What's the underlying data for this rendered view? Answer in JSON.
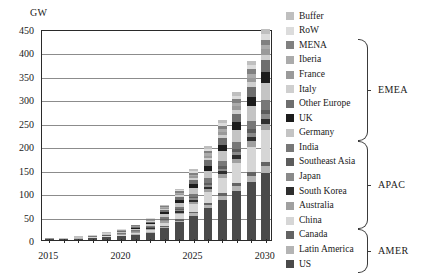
{
  "chart_data": {
    "type": "bar",
    "stacked": true,
    "title": "",
    "xlabel": "",
    "ylabel": "GW",
    "ylim": [
      0,
      450
    ],
    "ytick_step": 50,
    "ytick_labels": [
      "450",
      "400",
      "350",
      "300",
      "250",
      "200",
      "150",
      "100",
      "50",
      "0"
    ],
    "grid": true,
    "legend_position": "right",
    "categories": [
      "2015",
      "2016",
      "2017",
      "2018",
      "2019",
      "2020",
      "2021",
      "2022",
      "2023",
      "2024",
      "2025",
      "2026",
      "2027",
      "2028",
      "2029",
      "2030"
    ],
    "xtick_labels_shown": [
      "2015",
      "2020",
      "2025",
      "2030"
    ],
    "series": [
      {
        "name": "US",
        "group": "AMER",
        "color": "#4a4a4a",
        "values": [
          1.5,
          2.0,
          3.0,
          4.5,
          6.0,
          8.0,
          11.0,
          15.0,
          26.0,
          38.0,
          52.0,
          68.0,
          86.0,
          104.0,
          124.0,
          142.0
        ]
      },
      {
        "name": "Latin America",
        "group": "AMER",
        "color": "#b4b4b4",
        "values": [
          0.1,
          0.2,
          0.3,
          0.4,
          0.6,
          0.9,
          1.2,
          1.8,
          2.6,
          3.6,
          5.0,
          6.6,
          8.4,
          10.4,
          12.6,
          15.0
        ]
      },
      {
        "name": "Canada",
        "group": "AMER",
        "color": "#636363",
        "values": [
          0.1,
          0.1,
          0.2,
          0.3,
          0.4,
          0.6,
          0.8,
          1.1,
          1.6,
          2.2,
          3.0,
          4.0,
          5.0,
          6.2,
          7.4,
          8.8
        ]
      },
      {
        "name": "China",
        "group": "APAC",
        "color": "#d6d6d6",
        "values": [
          0.2,
          0.3,
          0.5,
          0.8,
          1.2,
          1.8,
          2.6,
          4.0,
          7.0,
          11.0,
          17.0,
          24.0,
          33.0,
          43.0,
          55.0,
          68.0
        ]
      },
      {
        "name": "Australia",
        "group": "APAC",
        "color": "#a0a0a0",
        "values": [
          0.1,
          0.1,
          0.2,
          0.3,
          0.5,
          0.8,
          1.1,
          1.6,
          2.4,
          3.4,
          4.6,
          6.0,
          7.6,
          9.4,
          11.4,
          13.4
        ]
      },
      {
        "name": "South Korea",
        "group": "APAC",
        "color": "#2e2e2e",
        "values": [
          0.1,
          0.1,
          0.2,
          0.3,
          0.4,
          0.6,
          0.9,
          1.3,
          2.0,
          2.8,
          3.8,
          5.0,
          6.4,
          7.8,
          9.4,
          11.0
        ]
      },
      {
        "name": "Japan",
        "group": "APAC",
        "color": "#8a8a8a",
        "values": [
          0.1,
          0.1,
          0.2,
          0.3,
          0.4,
          0.6,
          0.9,
          1.3,
          1.9,
          2.6,
          3.5,
          4.6,
          5.8,
          7.2,
          8.6,
          10.2
        ]
      },
      {
        "name": "Southeast Asia",
        "group": "APAC",
        "color": "#5c5c5c",
        "values": [
          0.1,
          0.1,
          0.1,
          0.2,
          0.3,
          0.5,
          0.7,
          1.0,
          1.5,
          2.2,
          3.0,
          4.0,
          5.2,
          6.4,
          7.8,
          9.2
        ]
      },
      {
        "name": "India",
        "group": "APAC",
        "color": "#777777",
        "values": [
          0.1,
          0.2,
          0.3,
          0.4,
          0.7,
          1.0,
          1.5,
          2.2,
          3.4,
          5.0,
          7.0,
          9.4,
          12.2,
          15.2,
          18.6,
          22.0
        ]
      },
      {
        "name": "Germany",
        "group": "EMEA",
        "color": "#c4c4c4",
        "values": [
          0.3,
          0.4,
          0.6,
          0.9,
          1.4,
          2.0,
          2.9,
          4.2,
          6.4,
          9.0,
          12.2,
          16.0,
          20.4,
          25.0,
          30.0,
          35.0
        ]
      },
      {
        "name": "UK",
        "group": "EMEA",
        "color": "#1c1c1c",
        "values": [
          0.2,
          0.3,
          0.4,
          0.6,
          0.9,
          1.3,
          1.9,
          2.8,
          4.2,
          6.0,
          8.2,
          10.8,
          13.6,
          16.8,
          20.2,
          24.0
        ]
      },
      {
        "name": "Other Europe",
        "group": "EMEA",
        "color": "#6e6e6e",
        "values": [
          0.2,
          0.3,
          0.4,
          0.6,
          0.9,
          1.4,
          2.0,
          3.0,
          4.6,
          6.6,
          9.0,
          11.8,
          15.0,
          18.4,
          22.2,
          26.0
        ]
      },
      {
        "name": "Italy",
        "group": "EMEA",
        "color": "#cfcfcf",
        "values": [
          0.1,
          0.1,
          0.2,
          0.3,
          0.4,
          0.6,
          0.9,
          1.3,
          2.0,
          2.8,
          3.8,
          5.0,
          6.4,
          7.8,
          9.4,
          11.0
        ]
      },
      {
        "name": "France",
        "group": "EMEA",
        "color": "#9a9a9a",
        "values": [
          0.1,
          0.1,
          0.2,
          0.3,
          0.4,
          0.6,
          0.9,
          1.3,
          2.0,
          2.8,
          3.8,
          5.0,
          6.2,
          7.6,
          9.2,
          10.8
        ]
      },
      {
        "name": "Iberia",
        "group": "EMEA",
        "color": "#ababab",
        "values": [
          0.1,
          0.1,
          0.2,
          0.3,
          0.4,
          0.6,
          0.9,
          1.3,
          1.9,
          2.7,
          3.7,
          4.8,
          6.0,
          7.4,
          8.8,
          10.4
        ]
      },
      {
        "name": "MENA",
        "group": "EMEA",
        "color": "#808080",
        "values": [
          0.1,
          0.1,
          0.2,
          0.3,
          0.4,
          0.6,
          0.9,
          1.3,
          2.0,
          2.8,
          3.8,
          5.0,
          6.2,
          7.6,
          9.2,
          10.8
        ]
      },
      {
        "name": "RoW",
        "group": "",
        "color": "#dcdcdc",
        "values": [
          0.1,
          0.1,
          0.2,
          0.3,
          0.4,
          0.6,
          0.9,
          1.4,
          2.0,
          2.8,
          3.8,
          5.0,
          6.4,
          7.8,
          9.4,
          11.0
        ]
      },
      {
        "name": "Buffer",
        "group": "",
        "color": "#bfbfbf",
        "values": [
          0.1,
          0.1,
          0.2,
          0.3,
          0.4,
          0.6,
          0.9,
          1.4,
          2.0,
          2.8,
          3.8,
          5.0,
          6.4,
          7.8,
          9.4,
          11.4
        ]
      }
    ],
    "totals": [
      3.4,
      4.7,
      7.4,
      11.1,
      16.2,
      23.2,
      32.9,
      47.3,
      75.5,
      109.1,
      148.2,
      200.0,
      256.2,
      315.8,
      382.6,
      450.0
    ]
  },
  "legend": {
    "entries": [
      {
        "label": "Buffer",
        "color": "#bfbfbf"
      },
      {
        "label": "RoW",
        "color": "#dcdcdc"
      },
      {
        "label": "MENA",
        "color": "#808080"
      },
      {
        "label": "Iberia",
        "color": "#ababab"
      },
      {
        "label": "France",
        "color": "#9a9a9a"
      },
      {
        "label": "Italy",
        "color": "#cfcfcf"
      },
      {
        "label": "Other Europe",
        "color": "#6e6e6e"
      },
      {
        "label": "UK",
        "color": "#1c1c1c"
      },
      {
        "label": "Germany",
        "color": "#c4c4c4"
      },
      {
        "label": "India",
        "color": "#777777"
      },
      {
        "label": "Southeast Asia",
        "color": "#5c5c5c"
      },
      {
        "label": "Japan",
        "color": "#8a8a8a"
      },
      {
        "label": "South Korea",
        "color": "#2e2e2e"
      },
      {
        "label": "Australia",
        "color": "#a0a0a0"
      },
      {
        "label": "China",
        "color": "#d6d6d6"
      },
      {
        "label": "Canada",
        "color": "#636363"
      },
      {
        "label": "Latin America",
        "color": "#b4b4b4"
      },
      {
        "label": "US",
        "color": "#4a4a4a"
      }
    ],
    "groups": [
      {
        "label": "EMEA",
        "first": 2,
        "last": 8
      },
      {
        "label": "APAC",
        "first": 9,
        "last": 14
      },
      {
        "label": "AMER",
        "first": 15,
        "last": 17
      }
    ]
  }
}
